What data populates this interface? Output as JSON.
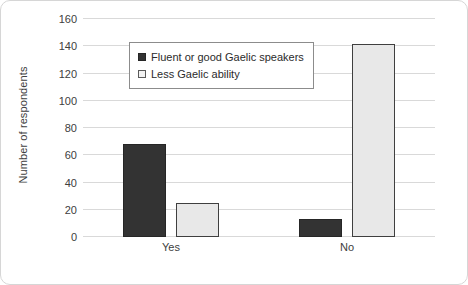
{
  "chart_data": {
    "type": "bar",
    "title": "",
    "subtitle": "",
    "xlabel": "",
    "ylabel": "Number of respondents",
    "categories": [
      "Yes",
      "No"
    ],
    "series": [
      {
        "name": "Fluent or good Gaelic speakers",
        "values": [
          68,
          13
        ],
        "color": "#333333",
        "swatch": "swatch-dark"
      },
      {
        "name": "Less Gaelic ability",
        "values": [
          25,
          142
        ],
        "color": "#E8E8E8",
        "swatch": "swatch-light"
      }
    ],
    "ylim": [
      0,
      160
    ],
    "yticks": [
      0,
      20,
      40,
      60,
      80,
      100,
      120,
      140,
      160
    ],
    "ytick_labels": [
      "0",
      "20",
      "40",
      "60",
      "80",
      "100",
      "120",
      "140",
      "160"
    ],
    "grid": true,
    "legend_position": "inside-top-left",
    "frame_color": "#D6D6D6",
    "gridline_color": "#D9D9D9",
    "text_color": "#404040"
  }
}
